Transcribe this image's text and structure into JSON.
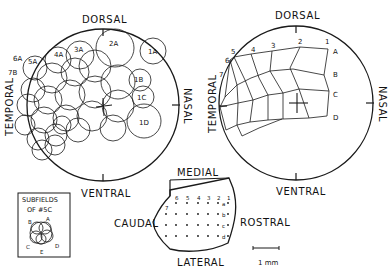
{
  "figure": {
    "left_panel": {
      "title": "Receptive field map (circles)",
      "labels": {
        "top": "DORSAL",
        "bottom": "VENTRAL",
        "left": "TEMPORAL",
        "right": "NASAL"
      },
      "field_labels": [
        {
          "text": "1A",
          "x": 152,
          "y": 51
        },
        {
          "text": "2A",
          "x": 113,
          "y": 46
        },
        {
          "text": "3A",
          "x": 78,
          "y": 52
        },
        {
          "text": "4A",
          "x": 58,
          "y": 56
        },
        {
          "text": "5A",
          "x": 33,
          "y": 62
        },
        {
          "text": "6A",
          "x": 14,
          "y": 60
        },
        {
          "text": "7B",
          "x": 8,
          "y": 74
        },
        {
          "text": "1B",
          "x": 138,
          "y": 79
        },
        {
          "text": "1C",
          "x": 142,
          "y": 98
        },
        {
          "text": "1D",
          "x": 145,
          "y": 121
        }
      ]
    },
    "right_panel": {
      "title": "Receptive field centers grid",
      "labels": {
        "top": "DORSAL",
        "bottom": "VENTRAL",
        "left": "TEMPORAL",
        "right": "NASAL"
      },
      "column_labels": [
        "1",
        "2",
        "3",
        "4",
        "5",
        "6",
        "7"
      ],
      "row_labels": [
        "A",
        "B",
        "C",
        "D"
      ]
    },
    "electrode_map": {
      "labels": {
        "top": "MEDIAL",
        "bottom": "LATERAL",
        "left": "CAUDAL",
        "right": "ROSTRAL"
      },
      "column_labels": [
        "6",
        "5",
        "4",
        "3",
        "2",
        "1"
      ],
      "extra_label": "7",
      "row_labels": [
        "a",
        "b",
        "c",
        "d"
      ]
    },
    "legend": {
      "title_line1": "SUBFIELDS",
      "title_line2": "OF #5C",
      "subfield_labels": [
        "A",
        "B",
        "C",
        "D",
        "E"
      ]
    },
    "scale_bar": {
      "label": "1 mm"
    }
  }
}
